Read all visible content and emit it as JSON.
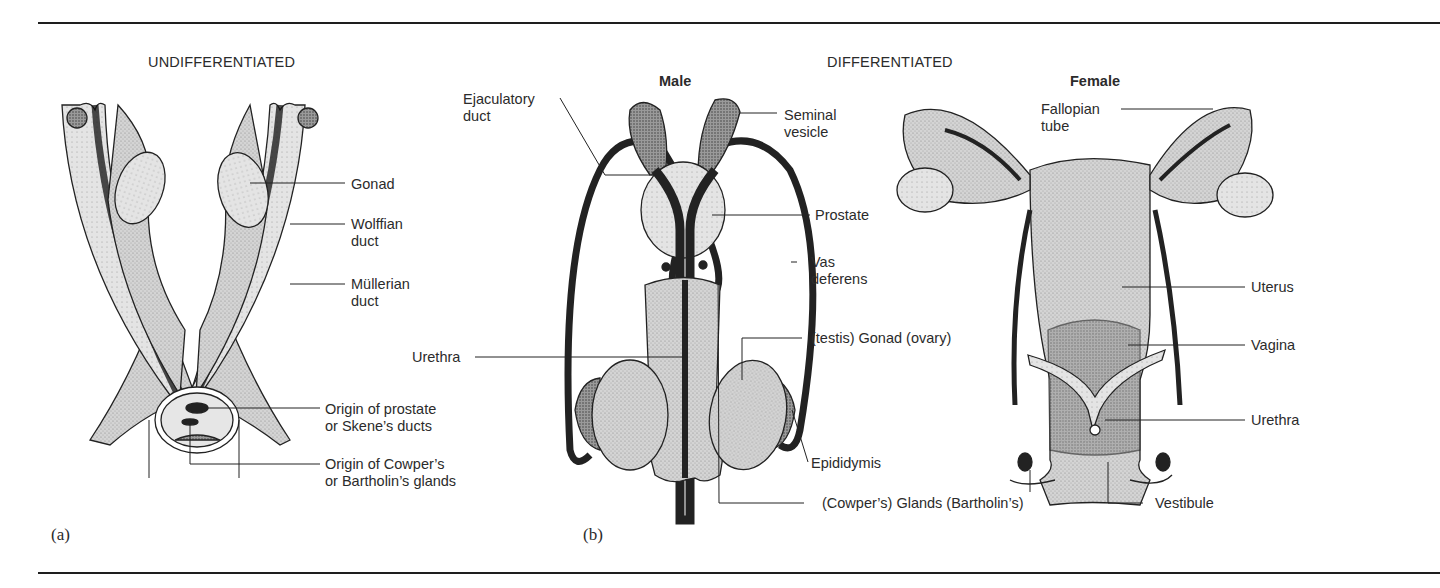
{
  "figure": {
    "panels": [
      {
        "id": "a",
        "label": "(a)",
        "heading": "UNDIFFERENTIATED"
      },
      {
        "id": "b",
        "label": "(b)",
        "heading": "DIFFERENTIATED"
      }
    ],
    "subheadings": {
      "male": "Male",
      "female": "Female"
    },
    "undifferentiated_labels": {
      "gonad": "Gonad",
      "wolffian": [
        "Wolffian",
        "duct"
      ],
      "mullerian": [
        "Müllerian",
        "duct"
      ],
      "prostate_origin": [
        "Origin of prostate",
        "or Skene’s ducts"
      ],
      "cowper_origin": [
        "Origin of Cowper’s",
        "or Bartholin’s glands"
      ]
    },
    "male_labels": {
      "ejaculatory": [
        "Ejaculatory",
        "duct"
      ],
      "seminal": [
        "Seminal",
        "vesicle"
      ],
      "prostate": "Prostate",
      "vas": [
        "Vas",
        "deferens"
      ],
      "urethra": "Urethra",
      "gonad": "(testis) Gonad (ovary)",
      "epididymis": "Epididymis",
      "glands": "(Cowper’s) Glands (Bartholin’s)"
    },
    "female_labels": {
      "fallopian": [
        "Fallopian",
        "tube"
      ],
      "uterus": "Uterus",
      "vagina": "Vagina",
      "urethra": "Urethra",
      "vestibule": "Vestibule"
    },
    "colors": {
      "ink": "#2b2b2b",
      "tissue_light": "#d6d6d6",
      "tissue_mid": "#bdbdbd",
      "tissue_dark": "#4a4a4a",
      "background": "#ffffff"
    }
  }
}
